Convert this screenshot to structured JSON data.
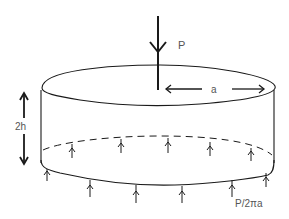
{
  "diagram": {
    "labels": {
      "load": "P",
      "radius": "a",
      "height": "2h",
      "reaction": "P/2πa"
    },
    "colors": {
      "stroke": "#1a1a1a",
      "label": "#555555",
      "background": "#ffffff"
    },
    "reaction_arrows": {
      "back_edge_count": 5,
      "front_edge_count": 6
    }
  }
}
